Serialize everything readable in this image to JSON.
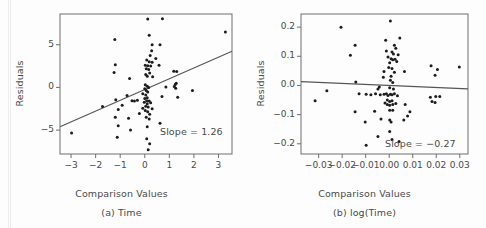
{
  "figure": {
    "background": "#fdfdfd",
    "frame_color": "#6e6e6e",
    "point_color": "#1c1c1c",
    "line_color": "#555555",
    "text_color": "#4a4a4a"
  },
  "chart_data": [
    {
      "type": "scatter",
      "panel_id": "a",
      "caption": "(a) Time",
      "title": "",
      "xlabel": "Comparison Values",
      "ylabel": "Residuals",
      "xlim": [
        -3.45,
        3.55
      ],
      "ylim": [
        -7.8,
        8.6
      ],
      "xticks": [
        -3,
        -2,
        -1,
        0,
        1,
        2,
        3
      ],
      "xtick_labels": [
        "−3",
        "−2",
        "−1",
        "0",
        "1",
        "2",
        "3"
      ],
      "yticks": [
        5,
        0,
        -5
      ],
      "ytick_labels": [
        "5",
        "0",
        "−5"
      ],
      "grid": false,
      "legend": "none",
      "annotation": "Slope = 1.26",
      "slope": 1.26,
      "fit_line": {
        "slope": 1.26,
        "intercept": -0.25
      },
      "points": [
        [
          0.12,
          8.0
        ],
        [
          0.72,
          8.05
        ],
        [
          3.28,
          6.5
        ],
        [
          -1.22,
          5.6
        ],
        [
          0.18,
          6.1
        ],
        [
          0.3,
          5.0
        ],
        [
          0.62,
          5.0
        ],
        [
          0.28,
          4.3
        ],
        [
          0.22,
          3.75
        ],
        [
          0.45,
          3.4
        ],
        [
          0.08,
          3.2
        ],
        [
          0.18,
          3.0
        ],
        [
          0.3,
          2.95
        ],
        [
          -1.2,
          2.65
        ],
        [
          0.02,
          2.6
        ],
        [
          0.12,
          2.55
        ],
        [
          0.24,
          2.5
        ],
        [
          0.58,
          2.6
        ],
        [
          1.18,
          1.9
        ],
        [
          1.3,
          1.85
        ],
        [
          -1.25,
          1.75
        ],
        [
          0.06,
          2.2
        ],
        [
          0.16,
          2.1
        ],
        [
          -0.62,
          1.05
        ],
        [
          0.2,
          1.7
        ],
        [
          0.04,
          1.5
        ],
        [
          0.1,
          1.3
        ],
        [
          0.32,
          1.25
        ],
        [
          1.24,
          0.35
        ],
        [
          1.2,
          0.1
        ],
        [
          1.28,
          0.5
        ],
        [
          1.26,
          -0.1
        ],
        [
          0.02,
          0.3
        ],
        [
          0.1,
          0.15
        ],
        [
          0.86,
          0.05
        ],
        [
          0.16,
          0.0
        ],
        [
          0.0,
          -0.15
        ],
        [
          0.06,
          -0.35
        ],
        [
          1.94,
          -0.35
        ],
        [
          0.12,
          -0.55
        ],
        [
          -0.08,
          -0.75
        ],
        [
          0.04,
          -0.9
        ],
        [
          -0.72,
          -0.95
        ],
        [
          0.7,
          -1.05
        ],
        [
          1.34,
          -1.15
        ],
        [
          0.1,
          -1.2
        ],
        [
          0.0,
          -1.3
        ],
        [
          -0.52,
          -1.55
        ],
        [
          -0.42,
          -1.6
        ],
        [
          -0.3,
          -1.5
        ],
        [
          0.08,
          -1.55
        ],
        [
          0.18,
          -1.6
        ],
        [
          -0.02,
          -1.75
        ],
        [
          0.1,
          -1.9
        ],
        [
          0.24,
          -1.8
        ],
        [
          -1.18,
          -1.45
        ],
        [
          -1.72,
          -2.25
        ],
        [
          -0.92,
          -2.1
        ],
        [
          0.04,
          -2.2
        ],
        [
          0.14,
          -2.3
        ],
        [
          -0.08,
          -2.45
        ],
        [
          0.3,
          -2.5
        ],
        [
          -1.08,
          -2.6
        ],
        [
          0.02,
          -2.7
        ],
        [
          0.12,
          -2.85
        ],
        [
          -0.22,
          -3.05
        ],
        [
          0.2,
          -3.15
        ],
        [
          -1.2,
          -3.5
        ],
        [
          -0.66,
          -3.6
        ],
        [
          0.06,
          -3.5
        ],
        [
          0.18,
          -3.7
        ],
        [
          0.62,
          -4.2
        ],
        [
          -1.08,
          -4.5
        ],
        [
          0.1,
          -4.6
        ],
        [
          -0.58,
          -5.0
        ],
        [
          -2.98,
          -5.35
        ],
        [
          -1.12,
          -5.85
        ],
        [
          0.08,
          -6.0
        ],
        [
          0.2,
          -6.6
        ],
        [
          0.14,
          -7.3
        ]
      ]
    },
    {
      "type": "scatter",
      "panel_id": "b",
      "caption": "(b) log(Time)",
      "title": "",
      "xlabel": "Comparison Values",
      "ylabel": "Residuals",
      "xlim": [
        -0.0375,
        0.0335
      ],
      "ylim": [
        -0.235,
        0.245
      ],
      "xticks": [
        -0.03,
        -0.02,
        -0.01,
        0.0,
        0.01,
        0.02,
        0.03
      ],
      "xtick_labels": [
        "−0.03",
        "−0.02",
        "−0.01",
        "0.00",
        "0.01",
        "0.02",
        "0.03"
      ],
      "yticks": [
        0.2,
        0.1,
        0.0,
        -0.1,
        -0.2
      ],
      "ytick_labels": [
        "0.2",
        "0.1",
        "0.0",
        "−0.1",
        "−0.2"
      ],
      "grid": false,
      "legend": "none",
      "annotation": "Slope = −0.27",
      "slope": -0.27,
      "fit_line": {
        "slope": -0.35,
        "intercept": 0.0
      },
      "points": [
        [
          0.0005,
          0.221
        ],
        [
          -0.0205,
          0.2
        ],
        [
          -0.0015,
          0.155
        ],
        [
          0.0045,
          0.163
        ],
        [
          -0.0145,
          0.138
        ],
        [
          0.0022,
          0.138
        ],
        [
          0.0028,
          0.128
        ],
        [
          -0.0165,
          0.104
        ],
        [
          -0.0012,
          0.118
        ],
        [
          0.0012,
          0.115
        ],
        [
          0.0018,
          0.108
        ],
        [
          0.0038,
          0.105
        ],
        [
          -0.0005,
          0.098
        ],
        [
          0.0008,
          0.092
        ],
        [
          0.0015,
          0.088
        ],
        [
          0.0025,
          0.09
        ],
        [
          0.0032,
          0.082
        ],
        [
          0.0002,
          0.078
        ],
        [
          0.0178,
          0.068
        ],
        [
          0.0298,
          0.063
        ],
        [
          -0.0002,
          0.062
        ],
        [
          0.0012,
          0.058
        ],
        [
          0.0205,
          0.055
        ],
        [
          -0.0022,
          0.048
        ],
        [
          0.0065,
          0.048
        ],
        [
          0.0022,
          0.045
        ],
        [
          0.0195,
          0.035
        ],
        [
          0.0008,
          0.032
        ],
        [
          -0.0025,
          0.028
        ],
        [
          -0.0142,
          0.012
        ],
        [
          0.0005,
          0.018
        ],
        [
          0.0015,
          0.01
        ],
        [
          -0.0042,
          -0.005
        ],
        [
          0.0002,
          -0.008
        ],
        [
          -0.0048,
          -0.012
        ],
        [
          0.0018,
          -0.012
        ],
        [
          -0.0315,
          -0.052
        ],
        [
          -0.0265,
          -0.018
        ],
        [
          -0.0128,
          -0.028
        ],
        [
          -0.0098,
          -0.03
        ],
        [
          -0.0078,
          -0.032
        ],
        [
          -0.0058,
          -0.028
        ],
        [
          -0.0038,
          -0.032
        ],
        [
          -0.0022,
          -0.03
        ],
        [
          -0.0012,
          -0.028
        ],
        [
          -0.0005,
          -0.034
        ],
        [
          0.0005,
          -0.03
        ],
        [
          0.0012,
          -0.032
        ],
        [
          0.0022,
          -0.028
        ],
        [
          0.0035,
          -0.035
        ],
        [
          0.0175,
          -0.04
        ],
        [
          0.0198,
          -0.038
        ],
        [
          0.0215,
          -0.038
        ],
        [
          0.0182,
          -0.055
        ],
        [
          0.0195,
          -0.058
        ],
        [
          -0.0008,
          -0.05
        ],
        [
          0.0002,
          -0.055
        ],
        [
          0.0012,
          -0.052
        ],
        [
          -0.0018,
          -0.06
        ],
        [
          -0.0008,
          -0.065
        ],
        [
          0.0002,
          -0.068
        ],
        [
          0.0015,
          -0.065
        ],
        [
          0.0028,
          -0.062
        ],
        [
          0.0068,
          -0.065
        ],
        [
          -0.0145,
          -0.09
        ],
        [
          -0.0062,
          -0.088
        ],
        [
          0.0002,
          -0.085
        ],
        [
          0.0015,
          -0.085
        ],
        [
          0.0088,
          -0.09
        ],
        [
          0.0078,
          -0.105
        ],
        [
          -0.0102,
          -0.125
        ],
        [
          -0.0035,
          -0.115
        ],
        [
          0.0002,
          -0.118
        ],
        [
          0.0008,
          -0.125
        ],
        [
          0.0062,
          -0.118
        ],
        [
          0.0002,
          -0.158
        ],
        [
          -0.0048,
          -0.175
        ],
        [
          0.0012,
          -0.185
        ],
        [
          0.0042,
          -0.192
        ],
        [
          -0.0098,
          -0.205
        ]
      ]
    }
  ]
}
